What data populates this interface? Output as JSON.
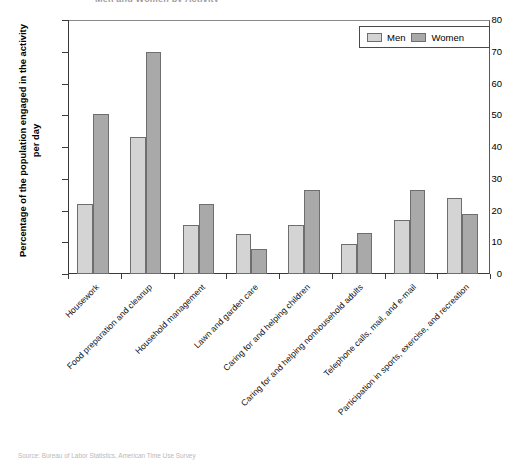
{
  "figure": {
    "title_cutoff": "Men and Women by Activity",
    "footer_cutoff": "Source: Bureau of Labor Statistics, American Time Use Survey"
  },
  "legend": {
    "position": "top-right",
    "entries": [
      {
        "label": "Men",
        "color": "#d4d4d4"
      },
      {
        "label": "Women",
        "color": "#a9a9a9"
      }
    ]
  },
  "axes": {
    "ylabel": "Percentage of the population engaged in the activity per day",
    "yticks": [
      "0",
      "10",
      "20",
      "30",
      "40",
      "50",
      "60",
      "70",
      "80"
    ]
  },
  "chart_data": {
    "type": "bar",
    "title": "",
    "xlabel": "",
    "ylabel": "Percentage of the population engaged in the activity per day",
    "ylim": [
      0,
      80
    ],
    "ytick_step": 10,
    "grid": false,
    "legend_position": "top right",
    "categories": [
      "Housework",
      "Food preparation and cleanup",
      "Household management",
      "Lawn and garden care",
      "Caring for and helping children",
      "Caring for and helping nonhousehold adults",
      "Telephone calls, mail, and e-mail",
      "Participation in sports, exercise, and recreation"
    ],
    "series": [
      {
        "name": "Men",
        "color": "#d4d4d4",
        "values": [
          22,
          43,
          15.5,
          12.5,
          15.5,
          9.5,
          17,
          24
        ]
      },
      {
        "name": "Women",
        "color": "#a9a9a9",
        "values": [
          50.5,
          70,
          22,
          8,
          26.5,
          13,
          26.5,
          19
        ]
      }
    ]
  }
}
